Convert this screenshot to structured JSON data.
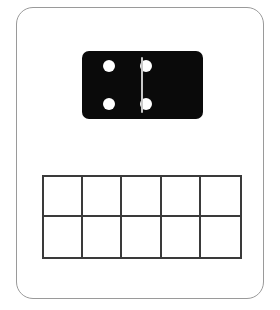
{
  "card": {
    "name": "domino-ten-frame-worksheet",
    "background_color": "#ffffff",
    "border_color": "#9a9a9a"
  },
  "domino": {
    "name": "domino-tile",
    "body_color": "#0a0a0a",
    "pip_color": "#ffffff",
    "divider_color": "#c9c9c9",
    "left_half": {
      "label": "4",
      "pip_count": 4,
      "arrangement": "two-by-two",
      "pips": [
        {
          "name": "pip-left-top-left",
          "x": 27,
          "y": 15
        },
        {
          "name": "pip-left-top-right",
          "x": 64,
          "y": 15
        },
        {
          "name": "pip-left-bottom-left",
          "x": 27,
          "y": 53
        },
        {
          "name": "pip-left-bottom-right",
          "x": 64,
          "y": 53
        }
      ]
    },
    "right_half": {
      "label": "3",
      "pip_count": 3,
      "arrangement": "diagonal",
      "pips": [
        {
          "name": "pip-right-top-right",
          "x": 109,
          "y": 15
        },
        {
          "name": "pip-right-center",
          "x": 91,
          "y": 34
        },
        {
          "name": "pip-right-bottom-left",
          "x": 72,
          "y": 53
        }
      ]
    },
    "total_pips": 7
  },
  "ten_frame": {
    "name": "ten-frame",
    "rows": 2,
    "columns": 5,
    "total_cells": 10,
    "filled_count": 0,
    "line_color": "#3a3a3a",
    "cells": [
      {
        "row": 0,
        "col": 0,
        "value": ""
      },
      {
        "row": 0,
        "col": 1,
        "value": ""
      },
      {
        "row": 0,
        "col": 2,
        "value": ""
      },
      {
        "row": 0,
        "col": 3,
        "value": ""
      },
      {
        "row": 0,
        "col": 4,
        "value": ""
      },
      {
        "row": 1,
        "col": 0,
        "value": ""
      },
      {
        "row": 1,
        "col": 1,
        "value": ""
      },
      {
        "row": 1,
        "col": 2,
        "value": ""
      },
      {
        "row": 1,
        "col": 3,
        "value": ""
      },
      {
        "row": 1,
        "col": 4,
        "value": ""
      }
    ]
  }
}
